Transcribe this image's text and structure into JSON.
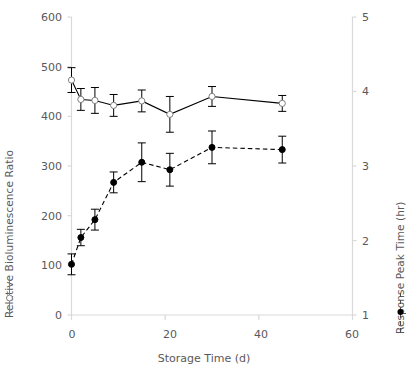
{
  "chart_data": {
    "type": "line",
    "title": "",
    "xlabel": "Storage Time (d)",
    "ylabel": "Relative Bioluminescence Ratio",
    "y2label": "Response Peak Time (hr)",
    "xlim": [
      0,
      60
    ],
    "ylim": [
      0,
      600
    ],
    "y2lim": [
      1,
      5
    ],
    "xticks": [
      0,
      20,
      40,
      60
    ],
    "yticks": [
      0,
      100,
      200,
      300,
      400,
      500,
      600
    ],
    "y2ticks": [
      1,
      2,
      3,
      4,
      5
    ],
    "grid": false,
    "legend_position": "axis-labels",
    "x": [
      0,
      2,
      5,
      9,
      15,
      21,
      30,
      45
    ],
    "series": [
      {
        "name": "Relative Bioluminescence Ratio",
        "axis": "left",
        "marker": "open-circle",
        "linestyle": "solid",
        "color": "#000000",
        "values": [
          473,
          434,
          432,
          422,
          431,
          404,
          440,
          426
        ],
        "errors": [
          25,
          22,
          26,
          22,
          22,
          36,
          20,
          16
        ]
      },
      {
        "name": "Response Peak Time (hr)",
        "axis": "right",
        "marker": "filled-circle",
        "linestyle": "dashed",
        "color": "#000000",
        "values": [
          1.68,
          2.04,
          2.28,
          2.78,
          3.05,
          2.95,
          3.25,
          3.22
        ],
        "errors": [
          0.14,
          0.11,
          0.14,
          0.14,
          0.26,
          0.22,
          0.22,
          0.18
        ]
      }
    ]
  },
  "axis": {
    "x_title": "Storage Time (d)",
    "left_title": "Relative Bioluminescence Ratio",
    "right_title": "Response Peak Time (hr)",
    "x_tick_labels": [
      "0",
      "20",
      "40",
      "60"
    ],
    "left_tick_labels": [
      "600",
      "500",
      "400",
      "300",
      "200",
      "100",
      "0"
    ],
    "right_tick_labels": [
      "5",
      "4",
      "3",
      "2",
      "1"
    ]
  },
  "colors": {
    "axis_line": "#d9d9d9",
    "text": "#595959",
    "series": "#000000"
  }
}
